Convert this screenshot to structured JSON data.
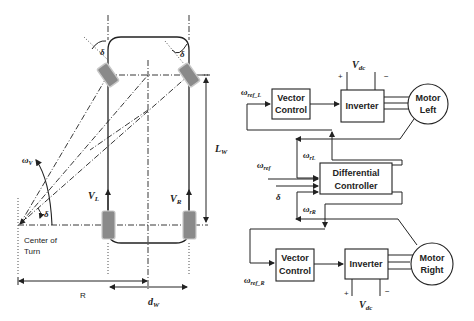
{
  "vehicle": {
    "steer_angle_left": "δ",
    "steer_angle_right": "δ",
    "wheelbase_label": "L",
    "wheelbase_sub": "W",
    "yaw_rate_label": "ω",
    "yaw_rate_sub": "V",
    "turn_angle": "δ",
    "vel_left": "V",
    "vel_left_sub": "L",
    "vel_right": "V",
    "vel_right_sub": "R",
    "center_label_1": "Center of",
    "center_label_2": "Turn",
    "radius_label": "R",
    "track_label": "d",
    "track_sub": "W"
  },
  "control": {
    "vdc_top": "V",
    "vdc_top_sub": "dc",
    "plus": "+",
    "minus": "−",
    "ref_left": "ω",
    "ref_left_sub": "ref_L",
    "vector_control_1": "Vector",
    "vector_control_2": "Control",
    "inverter": "Inverter",
    "motor_left_1": "Motor",
    "motor_left_2": "Left",
    "wr_left": "ω",
    "wr_left_sub": "rL",
    "w_ref": "ω",
    "w_ref_sub": "ref",
    "diff_1": "Differential",
    "diff_2": "Controller",
    "delta": "δ",
    "wr_right": "ω",
    "wr_right_sub": "rR",
    "ref_right": "ω",
    "ref_right_sub": "ref_R",
    "motor_right_1": "Motor",
    "motor_right_2": "Right",
    "vdc_bottom": "V",
    "vdc_bottom_sub": "dc"
  }
}
